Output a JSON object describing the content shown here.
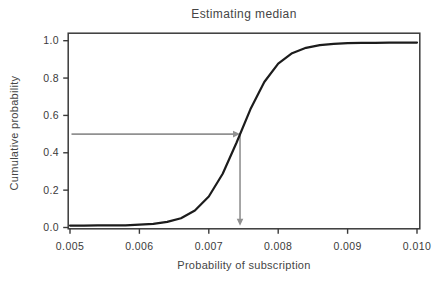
{
  "figure": {
    "background": "#ffffff"
  },
  "colors": {
    "curve": "#1c1c1c",
    "arrow": "#919191",
    "axis": "#3a3a3a",
    "text": "#454545"
  },
  "chart_data": {
    "type": "line",
    "title": "Estimating median",
    "xlabel": "Probability of subscription",
    "ylabel": "Cumulative probability",
    "xlim": [
      0.005,
      0.01
    ],
    "ylim": [
      0.0,
      1.0
    ],
    "grid": false,
    "legend": false,
    "x_ticks": [
      0.005,
      0.006,
      0.007,
      0.008,
      0.009,
      0.01
    ],
    "x_tick_labels": [
      "0.005",
      "0.006",
      "0.007",
      "0.008",
      "0.009",
      "0.010"
    ],
    "y_ticks": [
      1.0,
      0.8,
      0.6,
      0.4,
      0.2,
      0.0
    ],
    "y_tick_labels": [
      "1.0",
      "0.8",
      "0.6",
      "0.4",
      "0.2",
      "0.0"
    ],
    "series": [
      {
        "name": "cumulative probability (logistic CDF)",
        "x": [
          0.005,
          0.0052,
          0.0054,
          0.0056,
          0.0058,
          0.006,
          0.0062,
          0.0064,
          0.0066,
          0.0068,
          0.007,
          0.0072,
          0.0074,
          0.0076,
          0.0078,
          0.008,
          0.0082,
          0.0084,
          0.0086,
          0.0088,
          0.009,
          0.0092,
          0.0094,
          0.0096,
          0.0098,
          0.01
        ],
        "y": [
          0.01,
          0.01,
          0.011,
          0.011,
          0.012,
          0.015,
          0.02,
          0.03,
          0.05,
          0.091,
          0.166,
          0.288,
          0.455,
          0.633,
          0.779,
          0.877,
          0.933,
          0.962,
          0.976,
          0.983,
          0.987,
          0.989,
          0.989,
          0.99,
          0.99,
          0.99
        ]
      }
    ],
    "annotations": {
      "median_estimate": 0.00745,
      "median_cumulative_probability": 0.5,
      "arrows": [
        {
          "direction": "right",
          "y": 0.5,
          "x_from": 0.005,
          "x_to": 0.00745
        },
        {
          "direction": "down",
          "x": 0.00745,
          "y_from": 0.5,
          "y_to": 0.01
        }
      ]
    }
  }
}
